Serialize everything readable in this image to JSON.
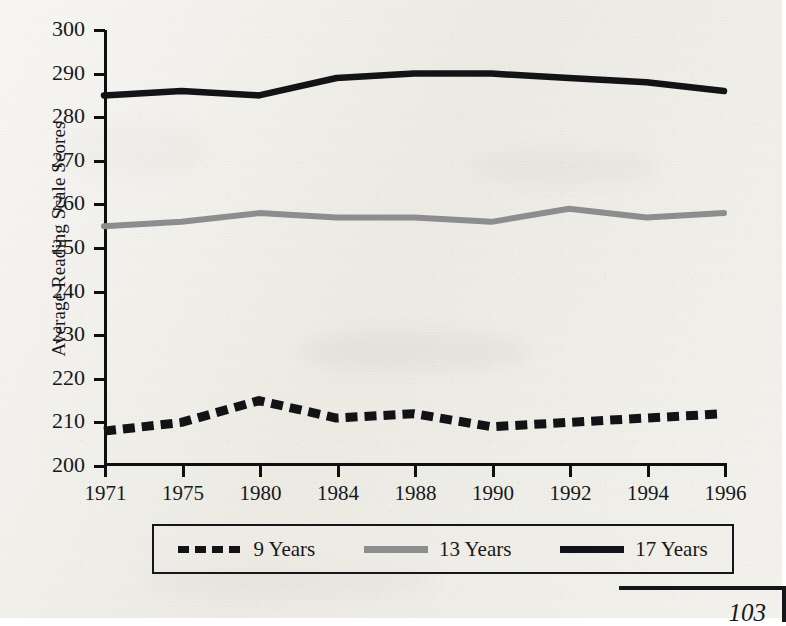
{
  "chart_data": {
    "type": "line",
    "title": "",
    "xlabel": "",
    "ylabel": "Average Reading Scale Scores",
    "categories": [
      "1971",
      "1975",
      "1980",
      "1984",
      "1988",
      "1990",
      "1992",
      "1994",
      "1996"
    ],
    "ylim": [
      200,
      300
    ],
    "yticks": [
      200,
      210,
      220,
      230,
      240,
      250,
      260,
      270,
      280,
      290,
      300
    ],
    "grid": false,
    "legend_position": "bottom",
    "series": [
      {
        "name": "9 Years",
        "style": "dashed",
        "color": "#111316",
        "values": [
          208,
          210,
          215,
          211,
          212,
          209,
          210,
          211,
          212
        ]
      },
      {
        "name": "13 Years",
        "style": "solid",
        "color": "#8c8d8f",
        "values": [
          255,
          256,
          258,
          257,
          257,
          256,
          259,
          257,
          258
        ]
      },
      {
        "name": "17 Years",
        "style": "solid",
        "color": "#111316",
        "values": [
          285,
          286,
          285,
          289,
          290,
          290,
          289,
          288,
          286
        ]
      }
    ]
  },
  "legend": {
    "items": [
      {
        "label": "9 Years",
        "swatch": "dashed-black-line"
      },
      {
        "label": "13 Years",
        "swatch": "solid-gray-line"
      },
      {
        "label": "17 Years",
        "swatch": "solid-black-line"
      }
    ]
  },
  "footer": {
    "page_number": "103"
  }
}
